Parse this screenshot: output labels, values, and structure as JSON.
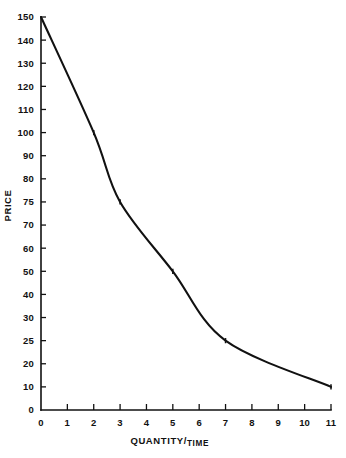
{
  "chart_data": {
    "type": "line",
    "title": "",
    "subtitle": "",
    "xlabel_main": "QUANTITY/",
    "xlabel_sub": "TIME",
    "xlabel_full": "QUANTITY/TIME",
    "ylabel": "PRICE",
    "grid": false,
    "legend": "none",
    "xlim": [
      0,
      11
    ],
    "ylim": [
      0,
      150
    ],
    "x_ticks": [
      0,
      1,
      2,
      3,
      4,
      5,
      6,
      7,
      8,
      9,
      10,
      11
    ],
    "x_tick_labels": [
      "0",
      "1",
      "2",
      "3",
      "4",
      "5",
      "6",
      "7",
      "8",
      "9",
      "10",
      "11"
    ],
    "y_ticks": [
      150,
      140,
      130,
      120,
      110,
      100,
      90,
      80,
      75,
      70,
      60,
      50,
      40,
      30,
      25,
      20,
      10,
      0
    ],
    "y_tick_labels": [
      "150",
      "140",
      "130",
      "120",
      "110",
      "100",
      "90",
      "80",
      "75",
      "70",
      "60",
      "50",
      "40",
      "30",
      "25",
      "20",
      "10",
      "0"
    ],
    "y_axis_note": "ticks evenly spaced by index, not by value",
    "series": [
      {
        "name": "demand",
        "x": [
          0,
          2,
          3,
          5,
          7,
          11
        ],
        "values": [
          150,
          100,
          75,
          50,
          25,
          10
        ],
        "marked_points": [
          {
            "x": 2,
            "y": 100
          },
          {
            "x": 3,
            "y": 75
          },
          {
            "x": 5,
            "y": 50
          },
          {
            "x": 7,
            "y": 25
          },
          {
            "x": 11,
            "y": 10
          }
        ]
      }
    ],
    "colors": {
      "curve": "#111111",
      "axis": "#111111",
      "background": "#ffffff"
    }
  }
}
